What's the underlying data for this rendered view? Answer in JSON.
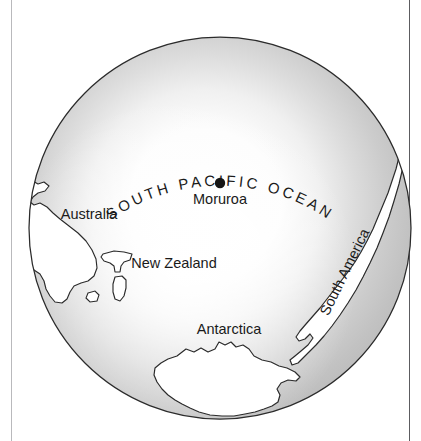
{
  "figure": {
    "kind": "globe-map",
    "projection": "orthographic",
    "view_center": "South Pacific",
    "background_color": "#ffffff",
    "outline_color": "#2b2b2b",
    "ocean_shade_color": "#c3c3c3",
    "land_fill_color": "#ffffff",
    "marker_color": "#151515"
  },
  "frame": {
    "left_rule_color": "#b9b9bc",
    "right_rule_color": "#5c5c60"
  },
  "globe": {
    "center_x": 220,
    "center_y": 228,
    "radius": 192
  },
  "ocean_label": {
    "text": "SOUTH PACIFIC OCEAN",
    "letters": [
      "S",
      "O",
      "U",
      "T",
      "H",
      " ",
      "P",
      "A",
      "C",
      "I",
      "F",
      "I",
      "C",
      " ",
      "O",
      "C",
      "E",
      "A",
      "N"
    ],
    "style": "curved-along-arc"
  },
  "places": [
    {
      "name": "Moruroa",
      "label": "Moruroa",
      "type": "site-marker",
      "x": 220,
      "y": 204,
      "marker_x": 220,
      "marker_y": 183,
      "marker_radius": 5.2,
      "has_marker": true,
      "rotation": 0
    },
    {
      "name": "Australia",
      "label": "Australia",
      "type": "continent",
      "x": 89,
      "y": 219,
      "has_marker": false,
      "rotation": 0
    },
    {
      "name": "New Zealand",
      "label": "New Zealand",
      "type": "country",
      "x": 174,
      "y": 268,
      "has_marker": false,
      "rotation": 0
    },
    {
      "name": "Antarctica",
      "label": "Antarctica",
      "type": "continent",
      "x": 229,
      "y": 334,
      "has_marker": false,
      "rotation": 0
    },
    {
      "name": "South America",
      "label": "South America",
      "type": "continent",
      "x": 349,
      "y": 274,
      "has_marker": false,
      "rotation": -64
    }
  ]
}
